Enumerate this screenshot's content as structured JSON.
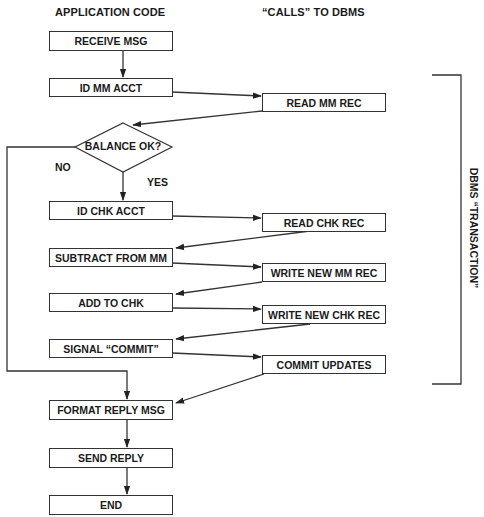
{
  "headers": {
    "left": "APPLICATION CODE",
    "right": "“CALLS” TO DBMS"
  },
  "application_steps": [
    {
      "id": "receive-msg",
      "label": "RECEIVE MSG"
    },
    {
      "id": "id-mm-acct",
      "label": "ID MM ACCT"
    },
    {
      "id": "balance-ok",
      "label": "BALANCE OK?",
      "shape": "decision"
    },
    {
      "id": "id-chk-acct",
      "label": "ID CHK ACCT"
    },
    {
      "id": "subtract-from-mm",
      "label": "SUBTRACT FROM MM"
    },
    {
      "id": "add-to-chk",
      "label": "ADD TO CHK"
    },
    {
      "id": "signal-commit",
      "label": "SIGNAL “COMMIT”"
    },
    {
      "id": "format-reply-msg",
      "label": "FORMAT REPLY MSG"
    },
    {
      "id": "send-reply",
      "label": "SEND REPLY"
    },
    {
      "id": "end",
      "label": "END"
    }
  ],
  "dbms_calls": [
    {
      "id": "read-mm-rec",
      "label": "READ MM REC"
    },
    {
      "id": "read-chk-rec",
      "label": "READ CHK REC"
    },
    {
      "id": "write-new-mm-rec",
      "label": "WRITE NEW MM REC"
    },
    {
      "id": "write-new-chk-rec",
      "label": "WRITE NEW CHK REC"
    },
    {
      "id": "commit-updates",
      "label": "COMMIT UPDATES"
    }
  ],
  "decision_branches": {
    "no": "NO",
    "yes": "YES"
  },
  "bracket_label": "DBMS “TRANSACTION”",
  "colors": {
    "line": "#333333",
    "text": "#1a1a1a",
    "background": "#ffffff"
  }
}
